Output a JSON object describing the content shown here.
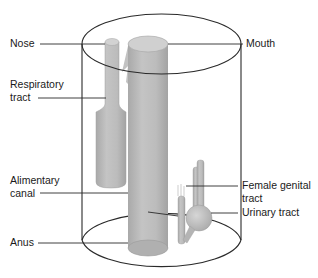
{
  "diagram": {
    "type": "anatomical schematic",
    "colors": {
      "outline": "#2a2a2a",
      "tube_fill": "#b9b9b9",
      "tube_light": "#d2d2d2",
      "tube_dark": "#9a9a9a",
      "background": "#ffffff"
    },
    "labels": {
      "nose": "Nose",
      "mouth": "Mouth",
      "respiratory_1": "Respiratory",
      "respiratory_2": "tract",
      "alimentary_1": "Alimentary",
      "alimentary_2": "canal",
      "anus": "Anus",
      "female_genital_1": "Female genital",
      "female_genital_2": "tract",
      "urinary": "Urinary tract"
    }
  }
}
